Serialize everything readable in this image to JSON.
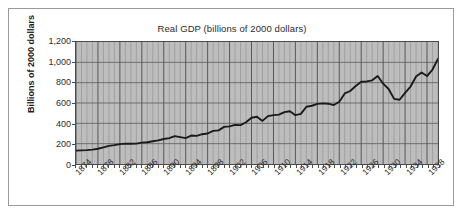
{
  "figure": {
    "title": "Real GDP (billions of 2000 dollars)",
    "y_axis_title": "Billions of 2000 dollars"
  },
  "chart_data": {
    "type": "line",
    "title": "Real GDP (billions of 2000 dollars)",
    "xlabel": "",
    "ylabel": "Billions of 2000 dollars",
    "xlim": [
      1874,
      1940
    ],
    "ylim": [
      0,
      1200
    ],
    "yticks": [
      0,
      200,
      400,
      600,
      800,
      1000,
      1200
    ],
    "ytick_labels": [
      "0",
      "200",
      "400",
      "600",
      "800",
      "1,000",
      "1,200"
    ],
    "xticks": [
      1874,
      1878,
      1882,
      1886,
      1890,
      1894,
      1898,
      1902,
      1906,
      1910,
      1914,
      1918,
      1922,
      1926,
      1930,
      1934,
      1938
    ],
    "xtick_labels": [
      "1874",
      "1878",
      "1882",
      "1886",
      "1890",
      "1894",
      "1898",
      "1902",
      "1906",
      "1910",
      "1914",
      "1918",
      "1922",
      "1926",
      "1930",
      "1934",
      "1938"
    ],
    "grid": true,
    "grid_minor_x": true,
    "legend": "none",
    "plot_background": "#bdbdbd",
    "line_color": "#1a1a1a",
    "series": [
      {
        "name": "Real GDP",
        "x": [
          1874,
          1875,
          1876,
          1877,
          1878,
          1879,
          1880,
          1881,
          1882,
          1883,
          1884,
          1885,
          1886,
          1887,
          1888,
          1889,
          1890,
          1891,
          1892,
          1893,
          1894,
          1895,
          1896,
          1897,
          1898,
          1899,
          1900,
          1901,
          1902,
          1903,
          1904,
          1905,
          1906,
          1907,
          1908,
          1909,
          1910,
          1911,
          1912,
          1913,
          1914,
          1915,
          1916,
          1917,
          1918,
          1919,
          1920,
          1921,
          1922,
          1923,
          1924,
          1925,
          1926,
          1927,
          1928,
          1929,
          1930,
          1931,
          1932,
          1933,
          1934,
          1935,
          1936,
          1937,
          1938,
          1939,
          1940
        ],
        "values": [
          132,
          134,
          137,
          142,
          150,
          164,
          178,
          186,
          196,
          200,
          199,
          200,
          210,
          214,
          224,
          232,
          246,
          255,
          274,
          264,
          255,
          280,
          276,
          293,
          300,
          326,
          331,
          365,
          370,
          385,
          382,
          411,
          455,
          465,
          424,
          471,
          481,
          485,
          511,
          519,
          480,
          493,
          563,
          573,
          592,
          596,
          593,
          580,
          613,
          694,
          718,
          767,
          809,
          812,
          823,
          865,
          790,
          738,
          641,
          632,
          700,
          762,
          861,
          900,
          865,
          929,
          1034
        ]
      }
    ],
    "annotations": []
  }
}
